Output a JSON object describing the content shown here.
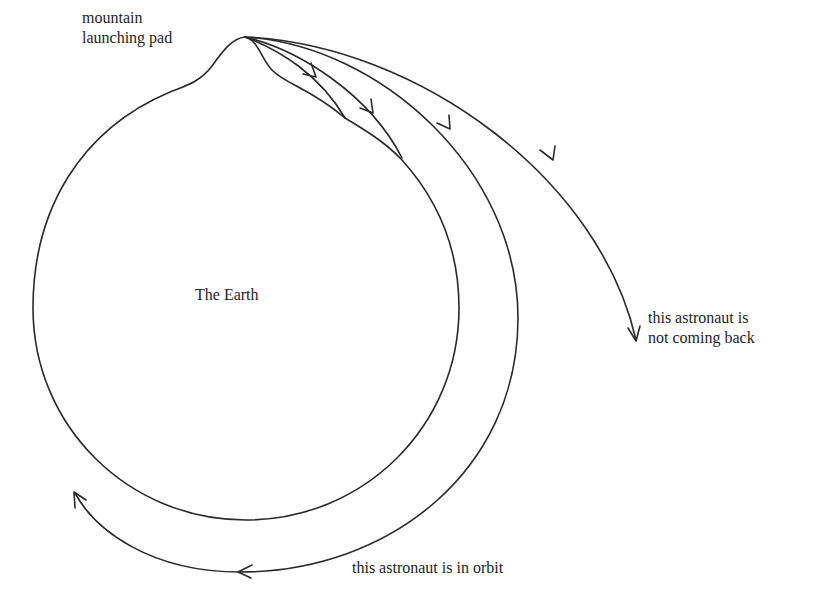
{
  "diagram": {
    "labels": {
      "mountain": [
        "mountain",
        "launching pad"
      ],
      "earth": "The Earth",
      "escape": [
        "this astronaut is",
        "not coming back"
      ],
      "orbit": "this astronaut is in orbit"
    },
    "colors": {
      "stroke": "#2a2a2a",
      "background": "#ffffff",
      "text": "#1e1e1e"
    },
    "trajectories": [
      {
        "name": "short-fall-1",
        "type": "falls back to Earth"
      },
      {
        "name": "short-fall-2",
        "type": "falls back to Earth"
      },
      {
        "name": "long-fall",
        "type": "falls back to Earth"
      },
      {
        "name": "orbit",
        "type": "circular orbit"
      },
      {
        "name": "escape",
        "type": "escape trajectory"
      }
    ]
  }
}
